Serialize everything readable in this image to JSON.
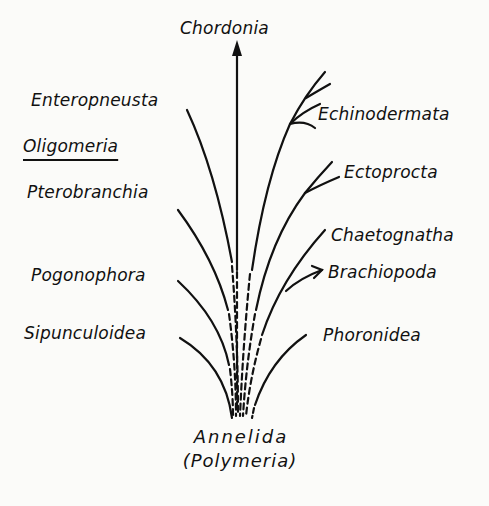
{
  "diagram": {
    "type": "phylogenetic-tree",
    "top": {
      "label": "Chordonia"
    },
    "root": {
      "label": "Annelida",
      "sublabel": "(Polymeria)"
    },
    "group_label": "Oligomeria",
    "left_branches": [
      {
        "label": "Enteropneusta"
      },
      {
        "label": "Pterobranchia"
      },
      {
        "label": "Pogonophora"
      },
      {
        "label": "Sipunculoidea"
      }
    ],
    "right_branches": [
      {
        "label": "Echinodermata"
      },
      {
        "label": "Ectoprocta"
      },
      {
        "label": "Chaetognatha"
      },
      {
        "label": "Brachiopoda"
      },
      {
        "label": "Phoronidea"
      }
    ],
    "colors": {
      "ink": "#111111",
      "paper": "#fbfbf9"
    }
  }
}
